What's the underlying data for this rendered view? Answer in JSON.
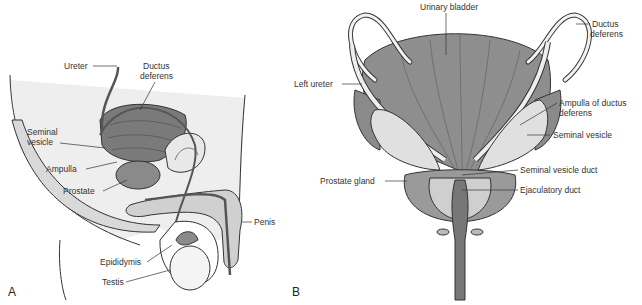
{
  "figure": {
    "panels": [
      {
        "letter": "A",
        "view": "sagittal",
        "labels": {
          "ureter": "Ureter",
          "ductus_deferens_1": "Ductus",
          "ductus_deferens_2": "deferens",
          "seminal_vesicle_1": "Seminal",
          "seminal_vesicle_2": "vesicle",
          "ampulla": "Ampulla",
          "prostate": "Prostate",
          "penis": "Penis",
          "epididymis": "Epididymis",
          "testis": "Testis"
        }
      },
      {
        "letter": "B",
        "view": "posterior",
        "labels": {
          "urinary_bladder": "Urinary bladder",
          "ductus_deferens_1": "Ductus",
          "ductus_deferens_2": "deferens",
          "left_ureter": "Left ureter",
          "ampulla_1": "Ampulla of ductus",
          "ampulla_2": "deferens",
          "seminal_vesicle": "Seminal vesicle",
          "seminal_vesicle_duct": "Seminal vesicle duct",
          "prostate_gland": "Prostate gland",
          "ejaculatory_duct": "Ejaculatory duct"
        }
      }
    ],
    "colors": {
      "organ_dark": "#6e6e6e",
      "organ_mid": "#9a9a9a",
      "tissue_light": "#d9d9d9",
      "outline": "#333333",
      "background": "#ffffff"
    }
  }
}
